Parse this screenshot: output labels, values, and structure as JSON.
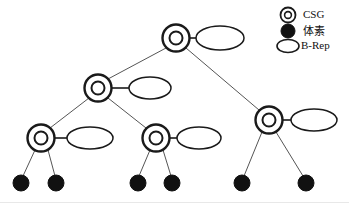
{
  "figure": {
    "kind": "tree-diagram",
    "title": "",
    "background_color": "#ffffff",
    "stroke_color": "#1a1a1a",
    "fill_color": "#111111",
    "edge_color": "#555555",
    "width": 349,
    "height": 203
  },
  "legend": {
    "position": "top-right",
    "items": [
      {
        "id": "legend-csg",
        "label": "CSG",
        "glyph": "double-circle-icon",
        "icon_name": "csg-node-icon",
        "x": 288,
        "y": 15,
        "label_x": 303,
        "style": "outline-double-circle"
      },
      {
        "id": "legend-voxel",
        "label": "体素",
        "glyph": "filled-circle-icon",
        "icon_name": "voxel-node-icon",
        "x": 288,
        "y": 31,
        "label_x": 303,
        "style": "solid-circle"
      },
      {
        "id": "legend-brep",
        "label": "B-Rep",
        "glyph": "ellipse-icon",
        "icon_name": "brep-node-icon",
        "x": 288,
        "y": 46,
        "label_x": 301,
        "style": "outline-ellipse"
      }
    ]
  },
  "tree": {
    "csg_nodes": [
      {
        "id": "n-root",
        "label": "",
        "x": 176,
        "y": 38,
        "outer_r": 13.5,
        "inner_r": 6.5,
        "level": 0
      },
      {
        "id": "n-l1",
        "label": "",
        "x": 98,
        "y": 88,
        "outer_r": 13.5,
        "inner_r": 6.5,
        "level": 1
      },
      {
        "id": "n-r1",
        "label": "",
        "x": 269,
        "y": 120,
        "outer_r": 13.5,
        "inner_r": 6.5,
        "level": 1
      },
      {
        "id": "n-l2",
        "label": "",
        "x": 41,
        "y": 138,
        "outer_r": 13.5,
        "inner_r": 6.5,
        "level": 2
      },
      {
        "id": "n-m2",
        "label": "",
        "x": 156,
        "y": 138,
        "outer_r": 13.5,
        "inner_r": 6.5,
        "level": 2
      }
    ],
    "brep_nodes": [
      {
        "id": "b-root",
        "label": "",
        "cx": 220,
        "cy": 38,
        "rx": 24,
        "ry": 12,
        "attached_to": "n-root"
      },
      {
        "id": "b-l1",
        "label": "",
        "cx": 150,
        "cy": 88,
        "rx": 21,
        "ry": 11,
        "attached_to": "n-l1"
      },
      {
        "id": "b-r1",
        "label": "",
        "cx": 314,
        "cy": 120,
        "rx": 23,
        "ry": 11,
        "attached_to": "n-r1"
      },
      {
        "id": "b-l2",
        "label": "",
        "cx": 90,
        "cy": 138,
        "rx": 23,
        "ry": 11,
        "attached_to": "n-l2"
      },
      {
        "id": "b-m2",
        "label": "",
        "cx": 199,
        "cy": 138,
        "rx": 22,
        "ry": 11,
        "attached_to": "n-m2"
      }
    ],
    "voxel_leaves": [
      {
        "id": "v-1",
        "label": "",
        "cx": 21,
        "cy": 183,
        "r": 8,
        "parent": "n-l2"
      },
      {
        "id": "v-2",
        "label": "",
        "cx": 56,
        "cy": 183,
        "r": 8,
        "parent": "n-l2"
      },
      {
        "id": "v-3",
        "label": "",
        "cx": 138,
        "cy": 183,
        "r": 8,
        "parent": "n-m2"
      },
      {
        "id": "v-4",
        "label": "",
        "cx": 172,
        "cy": 183,
        "r": 8,
        "parent": "n-m2"
      },
      {
        "id": "v-5",
        "label": "",
        "cx": 242,
        "cy": 183,
        "r": 8,
        "parent": "n-r1"
      },
      {
        "id": "v-6",
        "label": "",
        "cx": 306,
        "cy": 183,
        "r": 8,
        "parent": "n-r1"
      }
    ],
    "tree_edges": [
      {
        "id": "e-root-l1",
        "from": "n-root",
        "to": "n-l1",
        "x1": 166,
        "y1": 48,
        "x2": 108,
        "y2": 79
      },
      {
        "id": "e-root-r1",
        "from": "n-root",
        "to": "n-r1",
        "x1": 186,
        "y1": 48,
        "x2": 259,
        "y2": 110
      },
      {
        "id": "e-l1-l2",
        "from": "n-l1",
        "to": "n-l2",
        "x1": 89,
        "y1": 98,
        "x2": 50,
        "y2": 128
      },
      {
        "id": "e-l1-m2",
        "from": "n-l1",
        "to": "n-m2",
        "x1": 108,
        "y1": 98,
        "x2": 146,
        "y2": 128
      },
      {
        "id": "e-l2-v1",
        "from": "n-l2",
        "to": "v-1",
        "x1": 35,
        "y1": 150,
        "x2": 23,
        "y2": 176
      },
      {
        "id": "e-l2-v2",
        "from": "n-l2",
        "to": "v-2",
        "x1": 48,
        "y1": 150,
        "x2": 55,
        "y2": 176
      },
      {
        "id": "e-m2-v3",
        "from": "n-m2",
        "to": "v-3",
        "x1": 150,
        "y1": 150,
        "x2": 139,
        "y2": 176
      },
      {
        "id": "e-m2-v4",
        "from": "n-m2",
        "to": "v-4",
        "x1": 163,
        "y1": 150,
        "x2": 171,
        "y2": 176
      },
      {
        "id": "e-r1-v5",
        "from": "n-r1",
        "to": "v-5",
        "x1": 262,
        "y1": 132,
        "x2": 244,
        "y2": 176
      },
      {
        "id": "e-r1-v6",
        "from": "n-r1",
        "to": "v-6",
        "x1": 276,
        "y1": 132,
        "x2": 303,
        "y2": 176
      }
    ],
    "attach_connectors": [
      {
        "id": "c-root",
        "x1": 189,
        "y1": 38,
        "x2": 196,
        "y2": 38
      },
      {
        "id": "c-l1",
        "x1": 111,
        "y1": 88,
        "x2": 129,
        "y2": 88
      },
      {
        "id": "c-r1",
        "x1": 282,
        "y1": 120,
        "x2": 291,
        "y2": 120
      },
      {
        "id": "c-l2",
        "x1": 54,
        "y1": 138,
        "x2": 67,
        "y2": 138
      },
      {
        "id": "c-m2",
        "x1": 169,
        "y1": 138,
        "x2": 177,
        "y2": 138
      }
    ]
  }
}
